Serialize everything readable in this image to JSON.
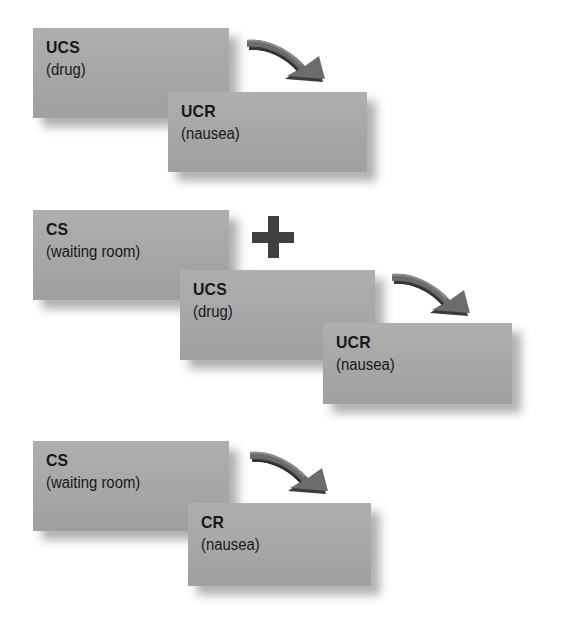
{
  "diagram": {
    "box_color": "#a8a8a8",
    "text_color": "#17181a",
    "arrow_color": "#4a4b4d",
    "plus_color": "#3f4042",
    "shadow_color": "#808080"
  },
  "rows": [
    {
      "name": "before-conditioning",
      "boxes": [
        {
          "code": "UCS",
          "desc": "(drug)"
        },
        {
          "code": "UCR",
          "desc": "(nausea)"
        }
      ],
      "arrow": {
        "label": "leads-to-arrow"
      },
      "plus": null
    },
    {
      "name": "during-conditioning",
      "boxes": [
        {
          "code": "CS",
          "desc": "(waiting room)"
        },
        {
          "code": "UCS",
          "desc": "(drug)"
        },
        {
          "code": "UCR",
          "desc": "(nausea)"
        }
      ],
      "arrow": {
        "label": "leads-to-arrow"
      },
      "plus": {
        "symbol": "+"
      }
    },
    {
      "name": "after-conditioning",
      "boxes": [
        {
          "code": "CS",
          "desc": "(waiting room)"
        },
        {
          "code": "CR",
          "desc": "(nausea)"
        }
      ],
      "arrow": {
        "label": "leads-to-arrow"
      },
      "plus": null
    }
  ]
}
